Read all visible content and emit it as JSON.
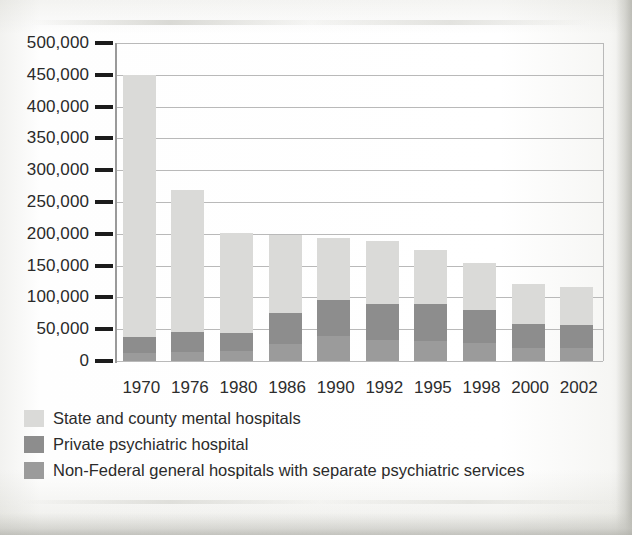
{
  "chart_data": {
    "type": "bar",
    "subtype": "stacked-vertical",
    "title": "",
    "xlabel": "",
    "ylabel": "",
    "ylim": [
      0,
      500000
    ],
    "grid": true,
    "legend_position": "below",
    "categories": [
      "1970",
      "1976",
      "1980",
      "1986",
      "1990",
      "1992",
      "1995",
      "1998",
      "2000",
      "2002"
    ],
    "ytick_labels": [
      "500,000",
      "450,000",
      "400,000",
      "350,000",
      "300,000",
      "250,000",
      "200,000",
      "150,000",
      "100,000",
      "50,000",
      "0"
    ],
    "ytick_values": [
      500000,
      450000,
      400000,
      350000,
      300000,
      250000,
      200000,
      150000,
      100000,
      50000,
      0
    ],
    "series": [
      {
        "name": "State and county mental hospitals",
        "color": "#dadad8",
        "values": [
          413000,
          223000,
          157000,
          122000,
          98000,
          98000,
          85000,
          74000,
          63000,
          60000
        ]
      },
      {
        "name": "Private psychiatric hospital",
        "color": "#8d8d8d",
        "values": [
          25000,
          32000,
          28000,
          50000,
          56000,
          57000,
          58000,
          52000,
          37000,
          36000
        ]
      },
      {
        "name": "Non-Federal general hospitals with separate psychiatric services",
        "color": "#9b9b9b",
        "values": [
          12000,
          14000,
          16000,
          26000,
          40000,
          33000,
          31000,
          28000,
          21000,
          21000
        ]
      }
    ],
    "totals": [
      450000,
      269000,
      201000,
      198000,
      194000,
      188000,
      174000,
      154000,
      121000,
      117000
    ]
  },
  "legend": {
    "items": [
      {
        "label": "State and county mental hospitals",
        "color": "#dadad8"
      },
      {
        "label": "Private psychiatric hospital",
        "color": "#8d8d8d"
      },
      {
        "label": "Non-Federal general hospitals with separate psychiatric services",
        "color": "#9b9b9b"
      }
    ]
  }
}
